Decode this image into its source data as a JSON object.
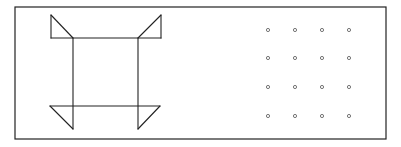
{
  "figure": {
    "frame": {
      "x": 15,
      "y": 7,
      "width": 371,
      "height": 132,
      "stroke": "#222222"
    },
    "line_color": "#222222",
    "dot_color": "#666666",
    "shape": {
      "lines": [
        {
          "x1": 51,
          "y1": 38,
          "x2": 161,
          "y2": 38
        },
        {
          "x1": 50,
          "y1": 106,
          "x2": 160,
          "y2": 106
        },
        {
          "x1": 73,
          "y1": 38,
          "x2": 73,
          "y2": 129
        },
        {
          "x1": 138,
          "y1": 38,
          "x2": 138,
          "y2": 129
        },
        {
          "x1": 51,
          "y1": 15,
          "x2": 51,
          "y2": 38
        },
        {
          "x1": 51,
          "y1": 15,
          "x2": 73,
          "y2": 38
        },
        {
          "x1": 161,
          "y1": 15,
          "x2": 161,
          "y2": 38
        },
        {
          "x1": 161,
          "y1": 15,
          "x2": 138,
          "y2": 38
        },
        {
          "x1": 50,
          "y1": 106,
          "x2": 73,
          "y2": 129
        },
        {
          "x1": 160,
          "y1": 106,
          "x2": 138,
          "y2": 129
        }
      ]
    },
    "dot_grid": {
      "columns_x": [
        268,
        295,
        322,
        349
      ],
      "rows_y": [
        30,
        58,
        87,
        116
      ],
      "radius": 1.6
    }
  }
}
